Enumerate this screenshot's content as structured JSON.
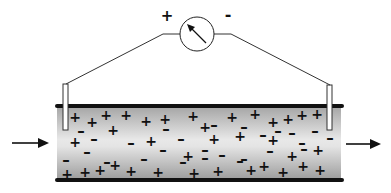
{
  "diagram": {
    "meter": {
      "positive_label": "+",
      "negative_label": "-",
      "center": [
        197,
        25
      ],
      "radius": 17
    },
    "colors": {
      "wall": "#111111",
      "fluid_light": "#e6e6e6",
      "fluid_dark": "#a9a9a9",
      "line": "#222222",
      "electrode_fill": "#ffffff"
    },
    "flow": {
      "inlet_arrow": "arrow-right",
      "outlet_arrow": "arrow-right"
    },
    "charges": [
      {
        "s": "+",
        "x": 75,
        "y": 117
      },
      {
        "s": "+",
        "x": 92,
        "y": 122
      },
      {
        "s": "+",
        "x": 106,
        "y": 115
      },
      {
        "s": "+",
        "x": 126,
        "y": 115
      },
      {
        "s": "+",
        "x": 146,
        "y": 121
      },
      {
        "s": "+",
        "x": 165,
        "y": 119
      },
      {
        "s": "+",
        "x": 193,
        "y": 116
      },
      {
        "s": "+",
        "x": 205,
        "y": 127
      },
      {
        "s": "+",
        "x": 232,
        "y": 117
      },
      {
        "s": "+",
        "x": 255,
        "y": 114
      },
      {
        "s": "+",
        "x": 273,
        "y": 122
      },
      {
        "s": "+",
        "x": 288,
        "y": 119
      },
      {
        "s": "+",
        "x": 302,
        "y": 115
      },
      {
        "s": "+",
        "x": 317,
        "y": 114
      },
      {
        "s": "+",
        "x": 75,
        "y": 142
      },
      {
        "s": "+",
        "x": 113,
        "y": 130
      },
      {
        "s": "+",
        "x": 151,
        "y": 141
      },
      {
        "s": "+",
        "x": 214,
        "y": 139
      },
      {
        "s": "+",
        "x": 240,
        "y": 136
      },
      {
        "s": "+",
        "x": 273,
        "y": 140
      },
      {
        "s": "+",
        "x": 318,
        "y": 150
      },
      {
        "s": "+",
        "x": 188,
        "y": 156
      },
      {
        "s": "+",
        "x": 292,
        "y": 156
      },
      {
        "s": "+",
        "x": 251,
        "y": 170
      },
      {
        "s": "+",
        "x": 67,
        "y": 174
      },
      {
        "s": "+",
        "x": 85,
        "y": 172
      },
      {
        "s": "+",
        "x": 100,
        "y": 170
      },
      {
        "s": "+",
        "x": 115,
        "y": 165
      },
      {
        "s": "+",
        "x": 131,
        "y": 171
      },
      {
        "s": "+",
        "x": 158,
        "y": 172
      },
      {
        "s": "+",
        "x": 194,
        "y": 173
      },
      {
        "s": "+",
        "x": 218,
        "y": 171
      },
      {
        "s": "+",
        "x": 264,
        "y": 166
      },
      {
        "s": "+",
        "x": 283,
        "y": 172
      },
      {
        "s": "+",
        "x": 303,
        "y": 166
      },
      {
        "s": "+",
        "x": 320,
        "y": 170
      },
      {
        "s": "+",
        "x": 246,
        "y": 190
      },
      {
        "s": "-",
        "x": 81,
        "y": 131
      },
      {
        "s": "-",
        "x": 94,
        "y": 139
      },
      {
        "s": "-",
        "x": 131,
        "y": 143
      },
      {
        "s": "-",
        "x": 166,
        "y": 129
      },
      {
        "s": "-",
        "x": 181,
        "y": 139
      },
      {
        "s": "-",
        "x": 214,
        "y": 125
      },
      {
        "s": "-",
        "x": 244,
        "y": 127
      },
      {
        "s": "-",
        "x": 263,
        "y": 135
      },
      {
        "s": "-",
        "x": 278,
        "y": 131
      },
      {
        "s": "-",
        "x": 292,
        "y": 133
      },
      {
        "s": "-",
        "x": 315,
        "y": 131
      },
      {
        "s": "-",
        "x": 302,
        "y": 143
      },
      {
        "s": "-",
        "x": 330,
        "y": 138
      },
      {
        "s": "-",
        "x": 87,
        "y": 152
      },
      {
        "s": "-",
        "x": 163,
        "y": 150
      },
      {
        "s": "-",
        "x": 205,
        "y": 150
      },
      {
        "s": "-",
        "x": 222,
        "y": 155
      },
      {
        "s": "-",
        "x": 244,
        "y": 159
      },
      {
        "s": "-",
        "x": 270,
        "y": 151
      },
      {
        "s": "-",
        "x": 304,
        "y": 149
      },
      {
        "s": "-",
        "x": 66,
        "y": 160
      },
      {
        "s": "-",
        "x": 107,
        "y": 162
      },
      {
        "s": "-",
        "x": 144,
        "y": 159
      },
      {
        "s": "-",
        "x": 183,
        "y": 162
      },
      {
        "s": "-",
        "x": 205,
        "y": 158
      },
      {
        "s": "-",
        "x": 240,
        "y": 161
      }
    ]
  }
}
